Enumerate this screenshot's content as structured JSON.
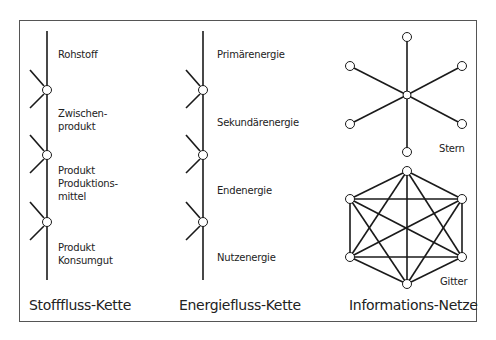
{
  "columns": [
    {
      "title": "Stofffluss-Kette",
      "labels": [
        [
          "Rohstoff"
        ],
        [
          "Zwischen-",
          "produkt"
        ],
        [
          "Produkt",
          "Produktions-",
          "mittel"
        ],
        [
          "Produkt",
          "Konsumgut"
        ]
      ]
    },
    {
      "title": "Energiefluss-Kette",
      "labels": [
        [
          "Primärenergie"
        ],
        [
          "Sekundärenergie"
        ],
        [
          "Endenergie"
        ],
        [
          "Nutzenergie"
        ]
      ]
    },
    {
      "title": "Informations-Netze",
      "labels": [
        [
          "Stern"
        ],
        [
          "Gitter"
        ]
      ]
    }
  ],
  "colors": {
    "line": "#1a1a1a",
    "border": "#555555",
    "node_fill": "#ffffff"
  }
}
